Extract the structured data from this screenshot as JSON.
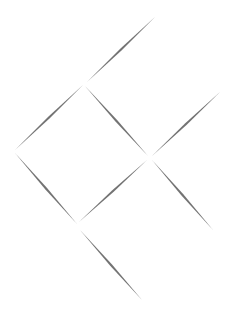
{
  "canvas": {
    "width": 230,
    "height": 316,
    "background": "#ffffff"
  },
  "stroke": {
    "color": "#5a5a5a",
    "width": 2.2
  },
  "segments": [
    {
      "name": "segment-top-right-upper",
      "x1": 87,
      "y1": 82,
      "x2": 155,
      "y2": 17
    },
    {
      "name": "segment-top-left",
      "x1": 15,
      "y1": 150,
      "x2": 83,
      "y2": 85
    },
    {
      "name": "segment-center-down",
      "x1": 85,
      "y1": 86,
      "x2": 148,
      "y2": 156
    },
    {
      "name": "segment-right-upper",
      "x1": 152,
      "y1": 156,
      "x2": 220,
      "y2": 92
    },
    {
      "name": "segment-left-down",
      "x1": 15,
      "y1": 153,
      "x2": 77,
      "y2": 224
    },
    {
      "name": "segment-center-up",
      "x1": 79,
      "y1": 222,
      "x2": 147,
      "y2": 160
    },
    {
      "name": "segment-right-down",
      "x1": 152,
      "y1": 160,
      "x2": 213,
      "y2": 230
    },
    {
      "name": "segment-bottom-down",
      "x1": 80,
      "y1": 230,
      "x2": 142,
      "y2": 300
    }
  ]
}
